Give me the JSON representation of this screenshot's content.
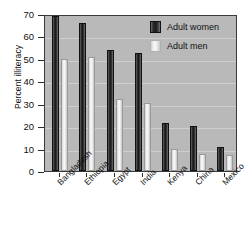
{
  "chart_data": {
    "type": "bar",
    "title": "",
    "xlabel": "",
    "ylabel": "Percent illiteracy",
    "ylim": [
      0,
      70
    ],
    "yticks": [
      0,
      10,
      20,
      30,
      40,
      50,
      60,
      70
    ],
    "ytick_labels": [
      "0",
      "10",
      "20",
      "30",
      "40",
      "50",
      "60",
      "70"
    ],
    "grid": true,
    "legend_position": "top-right",
    "categories": [
      "Bangladesh",
      "Ethiopia",
      "Egypt",
      "India",
      "Kenya",
      "China",
      "Mexico"
    ],
    "series": [
      {
        "name": "Adult women",
        "color": "#222222",
        "values": [
          69,
          66,
          54,
          52.5,
          21.5,
          20,
          10.5
        ]
      },
      {
        "name": "Adult men",
        "color": "#f0f0f0",
        "values": [
          50,
          51,
          32,
          30.5,
          10,
          7.5,
          7
        ]
      }
    ]
  },
  "legend": {
    "items": [
      {
        "label": "Adult women"
      },
      {
        "label": "Adult men"
      }
    ]
  },
  "colors": {
    "plot_background": "#b9b9b9",
    "grid": "#cfcfcf",
    "axis": "#2b2b2b",
    "page_background": "#ffffff"
  }
}
